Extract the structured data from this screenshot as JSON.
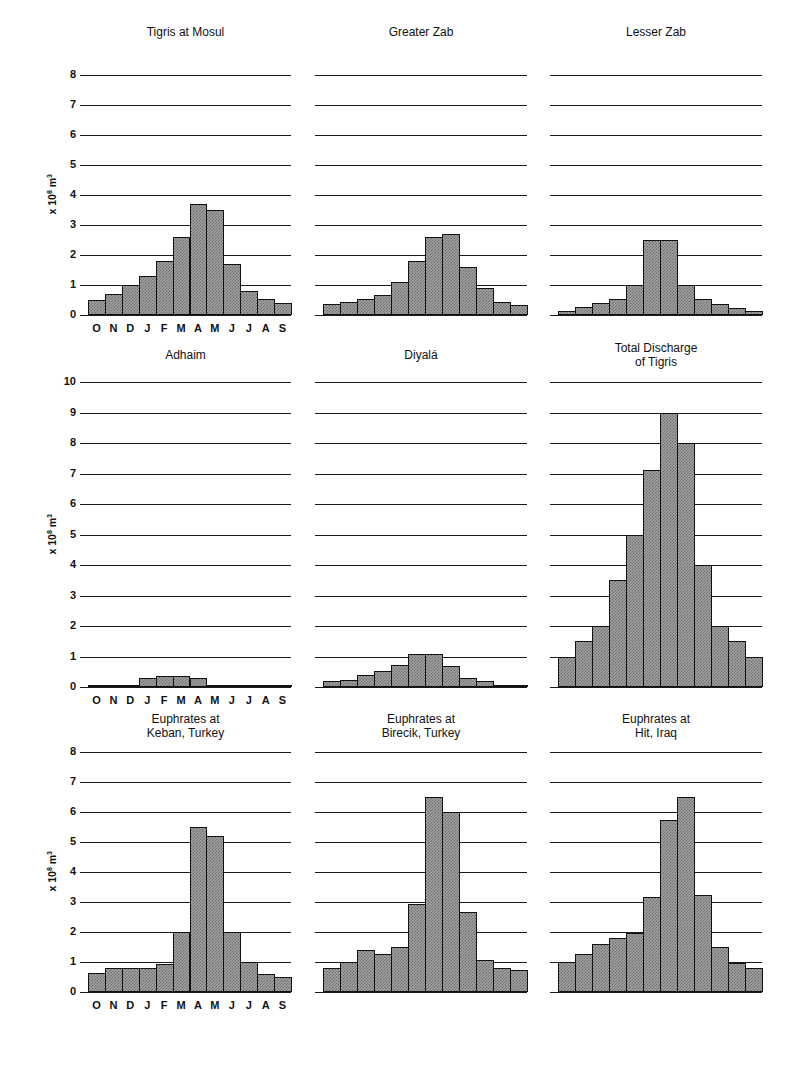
{
  "figure": {
    "ylabel_base": "x 10",
    "ylabel_exp": "8",
    "ylabel_unit": " m",
    "ylabel_unit_exp": "3",
    "months": [
      "O",
      "N",
      "D",
      "J",
      "F",
      "M",
      "A",
      "M",
      "J",
      "J",
      "A",
      "S"
    ]
  },
  "chart_data": [
    {
      "type": "bar",
      "title": "Tigris at Mosul",
      "ylabel": "x 10^8 m^3",
      "ylim": [
        0,
        8
      ],
      "row": 0,
      "col": 0,
      "categories": [
        "O",
        "N",
        "D",
        "J",
        "F",
        "M",
        "A",
        "M",
        "J",
        "J",
        "A",
        "S"
      ],
      "values": [
        0.5,
        0.7,
        1.0,
        1.3,
        1.8,
        2.6,
        3.7,
        3.5,
        1.7,
        0.8,
        0.55,
        0.4
      ],
      "show_yticks": true,
      "show_xticks": true
    },
    {
      "type": "bar",
      "title": "Greater Zab",
      "ylabel": "x 10^8 m^3",
      "ylim": [
        0,
        8
      ],
      "row": 0,
      "col": 1,
      "categories": [
        "O",
        "N",
        "D",
        "J",
        "F",
        "M",
        "A",
        "M",
        "J",
        "J",
        "A",
        "S"
      ],
      "values": [
        0.37,
        0.45,
        0.53,
        0.68,
        1.1,
        1.8,
        2.6,
        2.7,
        1.6,
        0.9,
        0.45,
        0.35
      ],
      "show_yticks": false,
      "show_xticks": false
    },
    {
      "type": "bar",
      "title": "Lesser Zab",
      "ylabel": "x 10^8 m^3",
      "ylim": [
        0,
        8
      ],
      "row": 0,
      "col": 2,
      "categories": [
        "O",
        "N",
        "D",
        "J",
        "F",
        "M",
        "A",
        "M",
        "J",
        "J",
        "A",
        "S"
      ],
      "values": [
        0.13,
        0.27,
        0.4,
        0.55,
        1.0,
        2.5,
        2.5,
        1.0,
        0.55,
        0.38,
        0.25,
        0.13
      ],
      "show_yticks": false,
      "show_xticks": false
    },
    {
      "type": "bar",
      "title": "Adhaim",
      "ylabel": "x 10^8 m^3",
      "ylim": [
        0,
        10
      ],
      "row": 1,
      "col": 0,
      "categories": [
        "O",
        "N",
        "D",
        "J",
        "F",
        "M",
        "A",
        "M",
        "J",
        "J",
        "A",
        "S"
      ],
      "values": [
        0.02,
        0.04,
        0.08,
        0.3,
        0.35,
        0.35,
        0.3,
        0.07,
        0.05,
        0.02,
        0.01,
        0.01
      ],
      "show_yticks": true,
      "show_xticks": true
    },
    {
      "type": "bar",
      "title": "Diyalá",
      "ylabel": "x 10^8 m^3",
      "ylim": [
        0,
        10
      ],
      "row": 1,
      "col": 1,
      "categories": [
        "O",
        "N",
        "D",
        "J",
        "F",
        "M",
        "A",
        "M",
        "J",
        "J",
        "A",
        "S"
      ],
      "values": [
        0.2,
        0.23,
        0.4,
        0.52,
        0.72,
        1.08,
        1.08,
        0.7,
        0.3,
        0.2,
        0.08,
        0.05
      ],
      "show_yticks": false,
      "show_xticks": false
    },
    {
      "type": "bar",
      "title": "Total Discharge of Tigris",
      "title_lines": [
        "Total Discharge",
        "of Tigris"
      ],
      "ylabel": "x 10^8 m^3",
      "ylim": [
        0,
        10
      ],
      "row": 1,
      "col": 2,
      "categories": [
        "O",
        "N",
        "D",
        "J",
        "F",
        "M",
        "A",
        "M",
        "J",
        "J",
        "A",
        "S"
      ],
      "values": [
        1.0,
        1.5,
        2.0,
        3.5,
        5.0,
        7.1,
        9.0,
        8.0,
        4.0,
        2.0,
        1.5,
        1.0
      ],
      "show_yticks": false,
      "show_xticks": false
    },
    {
      "type": "bar",
      "title": "Euphrates at Keban, Turkey",
      "title_lines": [
        "Euphrates at",
        "Keban, Turkey"
      ],
      "ylabel": "x 10^8 m^3",
      "ylim": [
        0,
        8
      ],
      "row": 2,
      "col": 0,
      "categories": [
        "O",
        "N",
        "D",
        "J",
        "F",
        "M",
        "A",
        "M",
        "J",
        "J",
        "A",
        "S"
      ],
      "values": [
        0.65,
        0.8,
        0.8,
        0.8,
        0.92,
        2.0,
        5.5,
        5.2,
        2.0,
        1.0,
        0.6,
        0.5
      ],
      "show_yticks": true,
      "show_xticks": true
    },
    {
      "type": "bar",
      "title": "Euphrates at Birecik, Turkey",
      "title_lines": [
        "Euphrates at",
        "Birecik, Turkey"
      ],
      "ylabel": "x 10^8 m^3",
      "ylim": [
        0,
        8
      ],
      "row": 2,
      "col": 1,
      "categories": [
        "O",
        "N",
        "D",
        "J",
        "F",
        "M",
        "A",
        "M",
        "J",
        "J",
        "A",
        "S"
      ],
      "values": [
        0.8,
        1.0,
        1.4,
        1.28,
        1.5,
        2.95,
        6.5,
        6.0,
        2.67,
        1.08,
        0.8,
        0.75
      ],
      "show_yticks": false,
      "show_xticks": false
    },
    {
      "type": "bar",
      "title": "Euphrates at Hit, Iraq",
      "title_lines": [
        "Euphrates at",
        "Hit, Iraq"
      ],
      "ylabel": "x 10^8 m^3",
      "ylim": [
        0,
        8
      ],
      "row": 2,
      "col": 2,
      "categories": [
        "O",
        "N",
        "D",
        "J",
        "F",
        "M",
        "A",
        "M",
        "J",
        "J",
        "A",
        "S"
      ],
      "values": [
        1.0,
        1.28,
        1.6,
        1.8,
        1.97,
        3.18,
        5.75,
        6.5,
        3.25,
        1.5,
        0.96,
        0.8
      ],
      "show_yticks": false,
      "show_xticks": false
    }
  ]
}
